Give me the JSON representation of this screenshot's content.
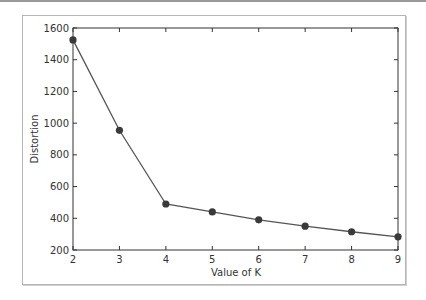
{
  "chart_data": {
    "type": "line",
    "title": "",
    "xlabel": "Value of K",
    "ylabel": "Distortion",
    "x": [
      2,
      3,
      4,
      5,
      6,
      7,
      8,
      9
    ],
    "series": [
      {
        "name": "Distortion",
        "values": [
          1525,
          955,
          490,
          440,
          390,
          350,
          315,
          283
        ],
        "marker": "circle",
        "color": "#444444"
      }
    ],
    "xlim": [
      2,
      9
    ],
    "ylim": [
      200,
      1600
    ],
    "xticks": [
      "2",
      "3",
      "4",
      "5",
      "6",
      "7",
      "8",
      "9"
    ],
    "yticks": [
      "200",
      "400",
      "600",
      "800",
      "1000",
      "1200",
      "1400",
      "1600"
    ],
    "grid": false,
    "legend": null
  },
  "colors": {
    "line": "#555555",
    "marker": "#3a3a3a",
    "axes": "#333333",
    "frame": "#b5b5b5"
  }
}
